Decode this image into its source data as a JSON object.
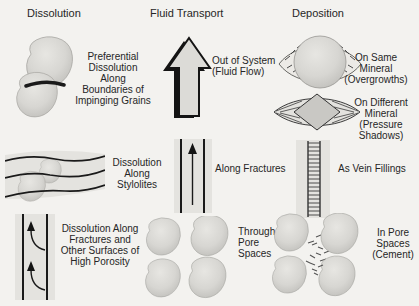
{
  "figure": {
    "palette": {
      "background": "#f3f2ef",
      "grain_fill": "#d6d5d1",
      "band_fill": "#e4e3df",
      "line": "#1a1a1a",
      "text": "#262626"
    },
    "columns": [
      {
        "heading": "Dissolution",
        "items": [
          {
            "illustration": "impinging-grains",
            "caption": "Preferential\nDissolution\nAlong\nBoundaries of\nImpinging Grains"
          },
          {
            "illustration": "stylolites",
            "caption": "Dissolution\nAlong\nStylolites"
          },
          {
            "illustration": "fracture-dissolution",
            "caption": "Dissolution Along\nFractures and\nOther Surfaces of\nHigh Porosity"
          }
        ]
      },
      {
        "heading": "Fluid Transport",
        "items": [
          {
            "illustration": "up-arrow",
            "caption": "Out of System\n(Fluid Flow)"
          },
          {
            "illustration": "fracture-flow",
            "caption": "Along Fractures"
          },
          {
            "illustration": "pore-cluster",
            "caption": "Through\nPore\nSpaces"
          }
        ]
      },
      {
        "heading": "Deposition",
        "items": [
          {
            "illustration": "overgrowth",
            "caption": "On Same\nMineral\n(Overgrowths)"
          },
          {
            "illustration": "pressure-shadow",
            "caption": "On Different\nMineral\n(Pressure\nShadows)"
          },
          {
            "illustration": "vein-filling",
            "caption": "As Vein Fillings"
          },
          {
            "illustration": "cement-cluster",
            "caption": "In Pore\nSpaces\n(Cement)"
          }
        ]
      }
    ]
  }
}
